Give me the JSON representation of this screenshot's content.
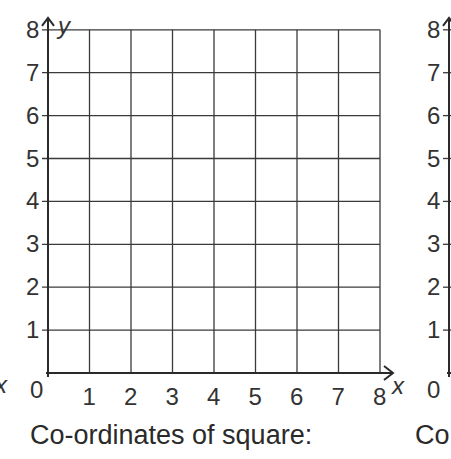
{
  "chart_data": [
    {
      "type": "grid",
      "title": "",
      "xlabel": "x",
      "ylabel": "y",
      "x_ticks": [
        "0",
        "1",
        "2",
        "3",
        "4",
        "5",
        "6",
        "7",
        "8"
      ],
      "y_ticks": [
        "1",
        "2",
        "3",
        "4",
        "5",
        "6",
        "7",
        "8"
      ],
      "xlim": [
        0,
        8
      ],
      "ylim": [
        0,
        8
      ],
      "grid": true,
      "points": [],
      "caption": "Co-ordinates of square:"
    },
    {
      "type": "grid",
      "partial": true,
      "xlabel": "x",
      "y_ticks": [
        "1",
        "2",
        "3",
        "4",
        "5",
        "6",
        "7",
        "8"
      ],
      "x_ticks": [
        "0"
      ],
      "caption": "Co"
    }
  ],
  "left_grid": {
    "origin_label": "0",
    "x_axis_label": "x",
    "y_axis_label": "y",
    "x_ticks": [
      "1",
      "2",
      "3",
      "4",
      "5",
      "6",
      "7",
      "8"
    ],
    "y_ticks": [
      "1",
      "2",
      "3",
      "4",
      "5",
      "6",
      "7",
      "8"
    ],
    "caption": "Co-ordinates of square:"
  },
  "right_grid": {
    "origin_label": "0",
    "y_ticks": [
      "1",
      "2",
      "3",
      "4",
      "5",
      "6",
      "7",
      "8"
    ],
    "caption": "Co"
  },
  "edge_label": "x"
}
